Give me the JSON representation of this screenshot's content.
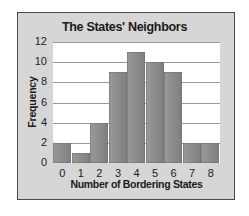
{
  "chart_data": {
    "type": "bar",
    "title": "The States' Neighbors",
    "xlabel": "Number of Bordering States",
    "ylabel": "Frequency",
    "categories": [
      "0",
      "1",
      "2",
      "3",
      "4",
      "5",
      "6",
      "7",
      "8"
    ],
    "values": [
      2,
      1,
      4,
      9,
      11,
      10,
      9,
      2,
      2
    ],
    "ylim": [
      0,
      12
    ],
    "yticks": [
      "0",
      "2",
      "4",
      "6",
      "8",
      "10",
      "12"
    ],
    "grid": true,
    "legend": null,
    "bar_color": "#8a8a8a",
    "background_color": "#d6d6d6"
  }
}
